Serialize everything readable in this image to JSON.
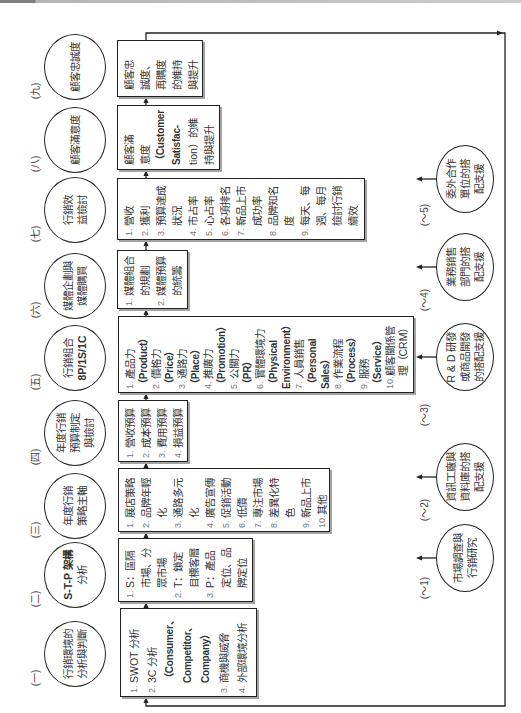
{
  "colors": {
    "line": "#222222",
    "text": "#333333",
    "number": "#777777",
    "shadow": "#a3a3a3",
    "header_bar_dark": "#7e7e7e",
    "header_bar_light": "#cdcdcd"
  },
  "main_flow": [
    {
      "marker": "(一)",
      "circle": [
        "行銷環境的",
        "分析與判斷"
      ],
      "items": [
        {
          "num": "1.",
          "lines": [
            "SWOT 分析"
          ]
        },
        {
          "num": "2.",
          "lines": [
            "3C 分析",
            "（Consumer、",
            "Competitor、",
            "Company）"
          ]
        },
        {
          "num": "3.",
          "lines": [
            "商機與威脅"
          ]
        },
        {
          "num": "4.",
          "lines": [
            "外部環境分析"
          ]
        }
      ]
    },
    {
      "marker": "(二)",
      "circle": [
        "S-T-P 架構",
        "分析"
      ],
      "items": [
        {
          "num": "1.",
          "lines": [
            "S：區隔",
            "市場、分",
            "眾市場"
          ]
        },
        {
          "num": "2.",
          "lines": [
            "T：鎖定",
            "目標客層"
          ]
        },
        {
          "num": "3.",
          "lines": [
            "P：產品",
            "定位、品",
            "牌定位"
          ]
        }
      ]
    },
    {
      "marker": "(三)",
      "circle": [
        "年度行銷",
        "策略主軸"
      ],
      "items": [
        {
          "num": "1.",
          "lines": [
            "展店策略"
          ]
        },
        {
          "num": "2.",
          "lines": [
            "品牌年輕",
            "化"
          ]
        },
        {
          "num": "3.",
          "lines": [
            "通路多元",
            "化"
          ]
        },
        {
          "num": "4.",
          "lines": [
            "廣告宣傳"
          ]
        },
        {
          "num": "5.",
          "lines": [
            "促銷活動"
          ]
        },
        {
          "num": "6.",
          "lines": [
            "低價"
          ]
        },
        {
          "num": "7.",
          "lines": [
            "專注市場"
          ]
        },
        {
          "num": "8.",
          "lines": [
            "差異化特",
            "色"
          ]
        },
        {
          "num": "9.",
          "lines": [
            "新品上市"
          ]
        },
        {
          "num": "10.",
          "lines": [
            "其他"
          ]
        }
      ]
    },
    {
      "marker": "(四)",
      "circle": [
        "年度行銷",
        "預算制定",
        "與檢討"
      ],
      "items": [
        {
          "num": "1.",
          "lines": [
            "營收預算"
          ]
        },
        {
          "num": "2.",
          "lines": [
            "成本預算"
          ]
        },
        {
          "num": "3.",
          "lines": [
            "費用預算"
          ]
        },
        {
          "num": "4.",
          "lines": [
            "損益預算"
          ]
        }
      ]
    },
    {
      "marker": "(五)",
      "circle": [
        "行銷組合",
        "8P/1S/1C"
      ],
      "items": [
        {
          "num": "1.",
          "lines": [
            "產品力",
            "（Product）"
          ]
        },
        {
          "num": "2.",
          "lines": [
            "價格力",
            "（Price）"
          ]
        },
        {
          "num": "3.",
          "lines": [
            "通路力",
            "（Place）"
          ]
        },
        {
          "num": "4.",
          "lines": [
            "推廣力",
            "（Promotion）"
          ]
        },
        {
          "num": "5.",
          "lines": [
            "公關力",
            "（PR）"
          ]
        },
        {
          "num": "6.",
          "lines": [
            "實體環境力",
            "（Physical",
            "Environment）"
          ]
        },
        {
          "num": "7.",
          "lines": [
            "人員銷售",
            "（Personal",
            "Sales）"
          ]
        },
        {
          "num": "8.",
          "lines": [
            "作業流程",
            "（Process）"
          ]
        },
        {
          "num": "9.",
          "lines": [
            "服務",
            "（Service）"
          ]
        },
        {
          "num": "10.",
          "lines": [
            "顧客關係管",
            "理（CRM）"
          ]
        }
      ]
    },
    {
      "marker": "(六)",
      "circle": [
        "媒體企劃與",
        "媒體購買"
      ],
      "items": [
        {
          "num": "1.",
          "lines": [
            "媒體組合",
            "的規劃"
          ]
        },
        {
          "num": "2.",
          "lines": [
            "媒體預算",
            "的統籌"
          ]
        }
      ]
    },
    {
      "marker": "(七)",
      "circle": [
        "行銷效",
        "益檢討"
      ],
      "items": [
        {
          "num": "1.",
          "lines": [
            "營收"
          ]
        },
        {
          "num": "2.",
          "lines": [
            "獲利"
          ]
        },
        {
          "num": "3.",
          "lines": [
            "預算達成",
            "狀況"
          ]
        },
        {
          "num": "4.",
          "lines": [
            "市占率"
          ]
        },
        {
          "num": "5.",
          "lines": [
            "心占率"
          ]
        },
        {
          "num": "6.",
          "lines": [
            "各項排名"
          ]
        },
        {
          "num": "7.",
          "lines": [
            "新品上市",
            "成功率"
          ]
        },
        {
          "num": "8.",
          "lines": [
            "品牌知名",
            "度"
          ]
        },
        {
          "num": "9.",
          "lines": [
            "每天、每",
            "週、每月",
            "檢討行銷",
            "績效"
          ]
        }
      ]
    },
    {
      "marker": "(八)",
      "circle": [
        "顧客滿意度"
      ],
      "text_lines": [
        "顧客滿",
        "意度",
        "（Customer",
        "Satisfac-",
        "tion）的維",
        "持與提升"
      ]
    },
    {
      "marker": "(九)",
      "circle": [
        "顧客忠誠度"
      ],
      "text_lines": [
        "顧客忠",
        "誠度、",
        "再購度",
        "的維持",
        "與提升"
      ]
    }
  ],
  "support": [
    {
      "marker": "(～1)",
      "circle": [
        "市場調查與",
        "行銷研究"
      ]
    },
    {
      "marker": "(～2)",
      "circle": [
        "資訊工廠與",
        "資料庫的搭",
        "配支援"
      ]
    },
    {
      "marker": "(～3)",
      "circle": [
        "R & D 研發",
        "或商品開發",
        "的搭配支援"
      ]
    },
    {
      "marker": "(～4)",
      "circle": [
        "業務銷售",
        "部門的搭",
        "配支援"
      ]
    },
    {
      "marker": "(～5)",
      "circle": [
        "委外合作",
        "單位的搭",
        "配支援"
      ]
    }
  ]
}
